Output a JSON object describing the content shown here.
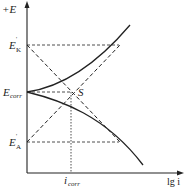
{
  "diagram": {
    "type": "polarization diagram (Evans diagram)",
    "y_axis": {
      "label": "+E"
    },
    "x_axis": {
      "label": "lg i"
    },
    "levels": {
      "E_K": {
        "symbol": "E",
        "sub": "K",
        "sup": "'"
      },
      "E_corr": {
        "symbol": "E",
        "sub": "corr"
      },
      "E_A": {
        "symbol": "E",
        "sub": "A",
        "sup": "'"
      }
    },
    "intersection_label": "S",
    "x_marker": {
      "symbol": "i",
      "sub": "corr"
    },
    "colors": {
      "line": "#222222",
      "background": "#ffffff"
    }
  }
}
